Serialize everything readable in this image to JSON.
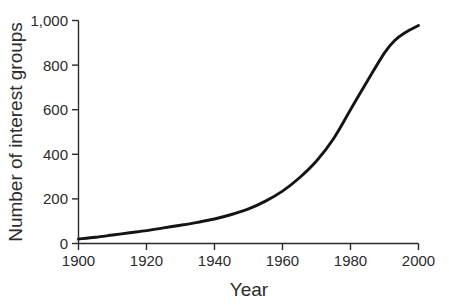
{
  "chart_data": {
    "type": "line",
    "title": "",
    "subtitle": "",
    "xlabel": "Year",
    "ylabel": "Number of interest groups",
    "xlim": [
      1900,
      2000
    ],
    "ylim": [
      0,
      1000
    ],
    "grid": false,
    "legend": false,
    "legend_position": "none",
    "x_ticks": [
      1900,
      1920,
      1940,
      1960,
      1980,
      2000
    ],
    "x_tick_labels": [
      "1900",
      "1920",
      "1940",
      "1960",
      "1980",
      "2000"
    ],
    "y_ticks": [
      0,
      200,
      400,
      600,
      800,
      1000
    ],
    "y_tick_labels": [
      "0",
      "200",
      "400",
      "600",
      "800",
      "1,000"
    ],
    "series": [
      {
        "name": "Number of interest groups",
        "color": "#141414",
        "x": [
          1900,
          1905,
          1910,
          1915,
          1920,
          1925,
          1930,
          1935,
          1940,
          1945,
          1950,
          1955,
          1960,
          1965,
          1970,
          1975,
          1980,
          1985,
          1990,
          1993,
          1996,
          2000
        ],
        "values": [
          20,
          28,
          38,
          48,
          58,
          70,
          82,
          95,
          110,
          130,
          155,
          190,
          235,
          295,
          370,
          470,
          600,
          730,
          855,
          910,
          945,
          978
        ]
      }
    ],
    "annotations": []
  },
  "figure": {
    "background_color": "#ffffff",
    "axis_color": "#2b2b2b",
    "text_color": "#2b2b2b"
  }
}
